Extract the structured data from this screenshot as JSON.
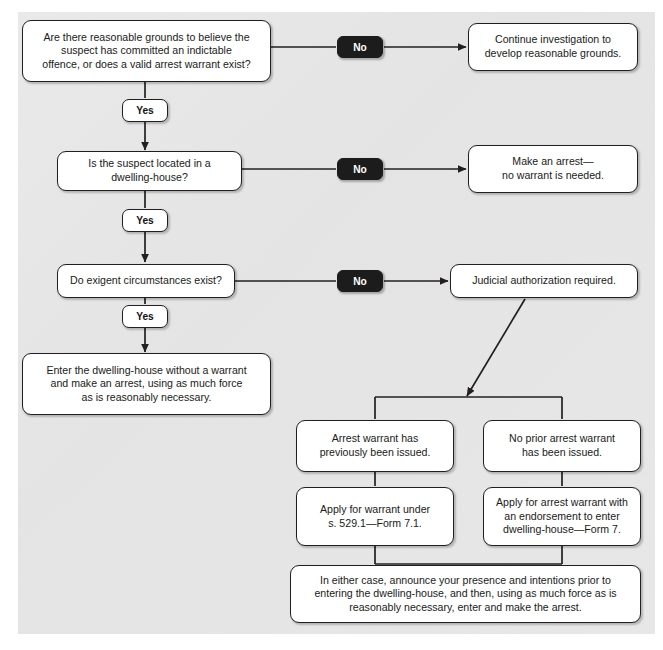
{
  "diagram": {
    "colors": {
      "panel_background": "#e6e6e6",
      "page_background": "#ffffff",
      "node_border": "#231f20",
      "node_fill": "#ffffff",
      "badge_no_fill": "#1c1c1c",
      "badge_no_text": "#ffffff",
      "badge_yes_fill": "#ffffff",
      "badge_yes_text": "#141414",
      "connector": "#231f20"
    }
  },
  "nodes": {
    "q1": "Are there reasonable grounds to believe the\nsuspect has committed an indictable\noffence, or does a valid arrest warrant exist?",
    "q1_no_outcome": "Continue investigation to\ndevelop reasonable grounds.",
    "q2": "Is the suspect located in a\ndwelling-house?",
    "q2_no_outcome": "Make an arrest—\nno warrant is needed.",
    "q3": "Do exigent circumstances exist?",
    "q3_no_outcome": "Judicial authorization required.",
    "q3_yes_outcome": "Enter the dwelling-house without a warrant\nand make an arrest, using as much force\nas is reasonably necessary.",
    "branch_left": "Arrest warrant has\npreviously been issued.",
    "branch_right": "No prior arrest warrant\nhas been issued.",
    "branch_left_action": "Apply for warrant under\ns. 529.1—Form 7.1.",
    "branch_right_action": "Apply for arrest warrant with\nan endorsement to enter\ndwelling-house—Form 7.",
    "final": "In either case, announce your presence and intentions prior to\nentering the dwelling-house, and then, using as much force as is\nreasonably necessary, enter and make the arrest."
  },
  "badges": {
    "no_1": "No",
    "no_2": "No",
    "no_3": "No",
    "yes_1": "Yes",
    "yes_2": "Yes",
    "yes_3": "Yes"
  }
}
